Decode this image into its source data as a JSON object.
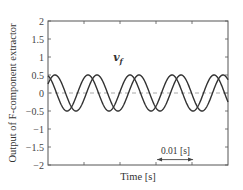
{
  "chart_data": {
    "type": "line",
    "title": "",
    "xlabel": "Time [s]",
    "ylabel": "Output of F-component extractor",
    "xlim": [
      0,
      0.05
    ],
    "ylim": [
      -2,
      2
    ],
    "y_ticks": [
      2,
      1.5,
      1,
      0.5,
      0,
      -0.5,
      -1,
      -1.5,
      -2
    ],
    "y_tick_labels": [
      "2",
      "1.5",
      "1",
      "0.5",
      "0",
      "−0.5",
      "−1",
      "−1.5",
      "−2"
    ],
    "x_tick_labels": [],
    "x_ticks_count_between": 4,
    "grid": false,
    "zero_line": {
      "y": 0,
      "style": "dashed",
      "color": "#aaaaaa"
    },
    "series_label": {
      "text": "v",
      "subscript": "f",
      "x": 0.0181,
      "y": 1.0
    },
    "annotations": [
      {
        "type": "double-arrow",
        "text": "0.01 [s]",
        "x_start": 0.0303,
        "x_end": 0.0403,
        "y": -1.85
      }
    ],
    "series": [
      {
        "name": "v_f phase A",
        "shape": "sinusoid",
        "amplitude": 0.5,
        "period_s": 0.01167,
        "peak_time_s": -0.00056,
        "peaks_t": [
          -0.0006,
          0.0111,
          0.0222,
          0.0339,
          0.0458
        ],
        "values_at_edges": {
          "t0": 0.43,
          "t_end": -0.3
        }
      },
      {
        "name": "v_f phase B",
        "shape": "sinusoid",
        "amplitude": 0.5,
        "period_s": 0.01167,
        "peak_time_s": 0.00194,
        "peaks_t": [
          0.0019,
          0.0136,
          0.0256,
          0.0369,
          0.0483
        ],
        "values_at_edges": {
          "t0": 0.25,
          "t_end": 0.35
        }
      }
    ],
    "legend": "none",
    "color": "#333333"
  }
}
